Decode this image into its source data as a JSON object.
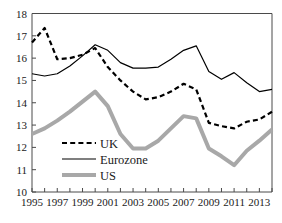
{
  "chart_data": {
    "type": "line",
    "title": "",
    "xlabel": "",
    "ylabel": "",
    "xlim": [
      1995,
      2014
    ],
    "ylim": [
      10,
      18
    ],
    "grid": false,
    "legend_position": "inside-bottom-left",
    "y_ticks": [
      10,
      11,
      12,
      13,
      14,
      15,
      16,
      17,
      18
    ],
    "x_ticks": [
      1995,
      1996,
      1997,
      1998,
      1999,
      2000,
      2001,
      2002,
      2003,
      2004,
      2005,
      2006,
      2007,
      2008,
      2009,
      2010,
      2011,
      2012,
      2013,
      2014
    ],
    "x_tick_labels": [
      "1995",
      "",
      "1997",
      "",
      "1999",
      "",
      "2001",
      "",
      "2003",
      "",
      "2005",
      "",
      "2007",
      "",
      "2009",
      "",
      "2011",
      "",
      "2013",
      ""
    ],
    "x": [
      1995,
      1996,
      1997,
      1998,
      1999,
      2000,
      2001,
      2002,
      2003,
      2004,
      2005,
      2006,
      2007,
      2008,
      2009,
      2010,
      2011,
      2012,
      2013,
      2014
    ],
    "series": [
      {
        "name": "UK",
        "style": "dashed",
        "color": "#000000",
        "width": 2.2,
        "values": [
          16.7,
          17.35,
          15.95,
          16.0,
          16.15,
          16.45,
          15.6,
          15.0,
          14.5,
          14.15,
          14.25,
          14.5,
          14.85,
          14.6,
          13.1,
          12.95,
          12.85,
          13.15,
          13.25,
          13.6
        ]
      },
      {
        "name": "Eurozone",
        "style": "solid",
        "color": "#000000",
        "width": 1.2,
        "values": [
          15.3,
          15.2,
          15.3,
          15.65,
          16.1,
          16.6,
          16.35,
          15.8,
          15.55,
          15.55,
          15.6,
          15.95,
          16.35,
          16.55,
          15.4,
          15.05,
          15.35,
          14.9,
          14.5,
          14.6
        ]
      },
      {
        "name": "US",
        "style": "solid",
        "color": "#a8a8a8",
        "width": 4.0,
        "values": [
          12.6,
          12.85,
          13.2,
          13.6,
          14.05,
          14.5,
          13.85,
          12.6,
          11.95,
          11.95,
          12.3,
          12.85,
          13.4,
          13.3,
          11.95,
          11.6,
          11.2,
          11.85,
          12.3,
          12.8
        ]
      }
    ],
    "legend": [
      {
        "label": "UK",
        "style": "dashed",
        "color": "#000000",
        "width": 2.2
      },
      {
        "label": "Eurozone",
        "style": "solid",
        "color": "#000000",
        "width": 1.2
      },
      {
        "label": "US",
        "style": "solid",
        "color": "#a8a8a8",
        "width": 4.0
      }
    ]
  }
}
